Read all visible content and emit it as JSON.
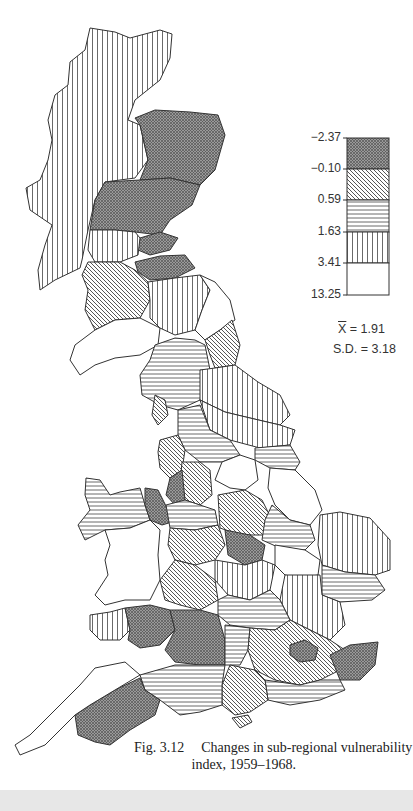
{
  "figure": {
    "number": "Fig. 3.12",
    "caption_line1": "Changes in sub-regional vulnerability",
    "caption_line2": "index, 1959–1968."
  },
  "legend": {
    "breaks": [
      "−2.37",
      "−0.10",
      "0.59",
      "1.63",
      "3.41",
      "13.25"
    ],
    "classes": [
      {
        "range": "−2.37 to −0.10",
        "pattern": "cross-hatch"
      },
      {
        "range": "−0.10 to 0.59",
        "pattern": "diagonal"
      },
      {
        "range": "0.59 to 1.63",
        "pattern": "horizontal"
      },
      {
        "range": "1.63 to 3.41",
        "pattern": "vertical"
      },
      {
        "range": "3.41 to 13.25",
        "pattern": "blank"
      }
    ]
  },
  "stats": {
    "mean_symbol": "X",
    "mean_value": " = 1.91",
    "sd": "S.D. = 3.18"
  },
  "colors": {
    "line": "#333333",
    "band": "#e7e7e7"
  }
}
